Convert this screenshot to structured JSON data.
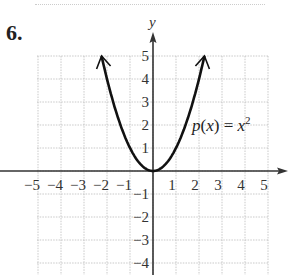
{
  "problem_number": "6.",
  "chart_data": {
    "type": "line",
    "title": "",
    "function_label": "p(x) = x²",
    "xlabel": "x",
    "ylabel": "y",
    "xlim": [
      -5,
      5
    ],
    "ylim": [
      -4,
      5
    ],
    "grid": true,
    "x_ticks": [
      "−5",
      "−4",
      "−3",
      "−2",
      "−1",
      "1",
      "2",
      "3",
      "4",
      "5"
    ],
    "y_ticks": [
      "5",
      "4",
      "3",
      "2",
      "1",
      "−1",
      "−2",
      "−3",
      "−4"
    ],
    "series": [
      {
        "name": "p(x) = x^2",
        "x": [
          -2.236,
          -2,
          -1.5,
          -1,
          -0.5,
          0,
          0.5,
          1,
          1.5,
          2,
          2.236
        ],
        "y": [
          5,
          4,
          2.25,
          1,
          0.25,
          0,
          0.25,
          1,
          2.25,
          4,
          5
        ],
        "end_arrows": true
      }
    ]
  },
  "labels": {
    "y_axis": "y",
    "func_p": "p",
    "func_open": "(",
    "func_x": "x",
    "func_close": ") = ",
    "func_rhs": "x",
    "func_exp": "2"
  }
}
